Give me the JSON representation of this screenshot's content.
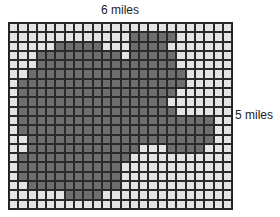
{
  "labels": {
    "width": "6 miles",
    "height": "5 miles"
  },
  "grid": {
    "cols": 24,
    "rows": 20,
    "fill_color": "#6e6e6e",
    "empty_color": "#e4e4e4",
    "line_color": "#222222",
    "mask": [
      "000000000000000000000000",
      "000000000000011111000000",
      "000001111100011110000000",
      "000111111111011111000000",
      "000111111111111111000000",
      "001111111111111111100000",
      "011111111111111111100000",
      "011111111111111111000000",
      "011111111111111110000000",
      "011111111111111111000000",
      "011111111111111111111100",
      "011111111111111111111100",
      "001111111111111111111100",
      "001111111111110001111000",
      "011111111111100000000000",
      "011111111111000000000000",
      "011111111111000000000000",
      "001111111111000000000000",
      "000000111100000000000000",
      "000000000000000000000000"
    ]
  }
}
